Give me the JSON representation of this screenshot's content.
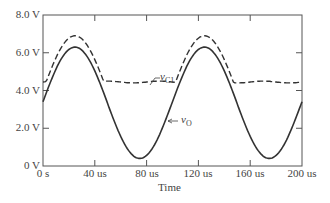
{
  "chart_data": {
    "type": "line",
    "title": "",
    "xlabel": "Time",
    "ylabel": "",
    "xlim": [
      0,
      200
    ],
    "ylim": [
      0,
      8
    ],
    "x_ticks": [
      "0 s",
      "40 us",
      "80 us",
      "120 us",
      "160 us",
      "200 us"
    ],
    "y_ticks": [
      "0 V",
      "2.0 V",
      "4.0 V",
      "6.0 V",
      "8.0 V"
    ],
    "grid": false,
    "legend": "inline annotations",
    "series": [
      {
        "name": "vO",
        "style": "solid",
        "x": [
          0,
          10,
          25,
          40,
          50,
          60,
          75,
          90,
          100,
          110,
          125,
          140,
          150,
          160,
          175,
          190,
          200
        ],
        "y": [
          3.2,
          5.3,
          6.3,
          5.3,
          3.2,
          1.4,
          0.4,
          1.4,
          3.2,
          5.3,
          6.3,
          5.3,
          3.2,
          1.4,
          0.4,
          1.4,
          3.2
        ]
      },
      {
        "name": "vC1",
        "style": "dashed",
        "x": [
          0,
          2,
          10,
          25,
          40,
          45,
          60,
          80,
          100,
          102,
          110,
          125,
          140,
          145,
          160,
          180,
          200
        ],
        "y": [
          4.4,
          4.5,
          6.1,
          6.9,
          5.7,
          4.5,
          4.45,
          4.5,
          4.5,
          4.6,
          6.1,
          6.9,
          5.7,
          4.5,
          4.45,
          4.5,
          4.45
        ]
      }
    ],
    "annotations": [
      {
        "text": "vC1",
        "target": "dashed flat segment ~4.5 V near 70 us"
      },
      {
        "text": "vO",
        "target": "solid curve falling edge near 95 us"
      }
    ]
  },
  "labels": {
    "y": [
      "8.0 V",
      "6.0 V",
      "4.0 V",
      "2.0 V",
      "0 V"
    ],
    "x": [
      "0 s",
      "40 us",
      "80 us",
      "120 us",
      "160 us",
      "200 us"
    ],
    "xlabel": "Time",
    "ann_vc_main": "v",
    "ann_vc_sub": "C1",
    "ann_vo_main": "v",
    "ann_vo_sub": "O"
  }
}
